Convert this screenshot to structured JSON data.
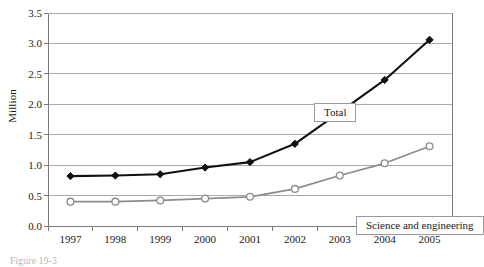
{
  "figure": {
    "ylabel": "Million",
    "caption": "Figure 19-3"
  },
  "callouts": {
    "total": "Total",
    "science_engineering": "Science and engineering"
  },
  "colors": {
    "total_line": "#111111",
    "se_line": "#8c8c8c",
    "gridline": "#aaaaaa",
    "axis": "#7a7a7a",
    "marker_fill_total": "#111111",
    "marker_fill_se": "#ffffff",
    "text": "#1a1a1a"
  },
  "chart_data": {
    "type": "line",
    "title": "",
    "xlabel": "",
    "ylabel": "Million",
    "categories": [
      "1997",
      "1998",
      "1999",
      "2000",
      "2001",
      "2002",
      "2003",
      "2004",
      "2005"
    ],
    "ylim": [
      0.0,
      3.5
    ],
    "yticks": [
      "0.0",
      "0.5",
      "1.0",
      "1.5",
      "2.0",
      "2.5",
      "3.0",
      "3.5"
    ],
    "ytick_values": [
      0.0,
      0.5,
      1.0,
      1.5,
      2.0,
      2.5,
      3.0,
      3.5
    ],
    "grid": "horizontal",
    "legend_position": "inside-callout-boxes",
    "series": [
      {
        "name": "Total",
        "marker": "filled-diamond",
        "color": "#111111",
        "values": [
          0.82,
          0.83,
          0.85,
          0.96,
          1.05,
          1.35,
          1.87,
          2.4,
          3.06
        ]
      },
      {
        "name": "Science and engineering",
        "marker": "open-circle",
        "color": "#8c8c8c",
        "values": [
          0.4,
          0.4,
          0.42,
          0.45,
          0.48,
          0.61,
          0.83,
          1.03,
          1.31
        ]
      }
    ]
  }
}
